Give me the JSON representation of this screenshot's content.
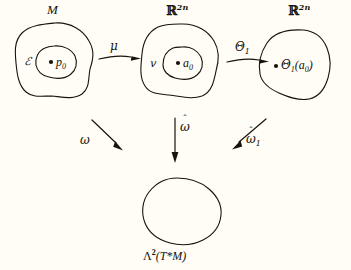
{
  "figure": {
    "kind": "commutative-diagram",
    "background_color": "#fffdf5",
    "ink_color": "#17130d"
  },
  "nodes": {
    "manifold": {
      "set_label": "M",
      "neighborhood_label": "ℰ",
      "point_label": "p",
      "point_sub": "0"
    },
    "chart_domain": {
      "set_label_base": "ℝ",
      "set_label_sup": "2n",
      "neighborhood_label": "ⅴ",
      "point_label": "a",
      "point_sub": "0"
    },
    "chart_image": {
      "set_label_base": "ℝ",
      "set_label_sup": "2n",
      "point_label": "Θ",
      "point_sub": "1",
      "point_arg": "(a",
      "point_arg_sub": "0",
      "point_arg_close": ")"
    },
    "target": {
      "label_lambda": "Λ",
      "label_sup": "2",
      "label_rest": "(T*M)"
    }
  },
  "arrows": {
    "mu": {
      "label": "μ"
    },
    "theta1": {
      "label": "Θ",
      "sub": "1"
    },
    "omega": {
      "label": "ω"
    },
    "omega_hat": {
      "label": "ω",
      "hat": "ˆ"
    },
    "omega_hat_1": {
      "label": "ω",
      "hat": "ˆ",
      "sub": "1"
    }
  }
}
